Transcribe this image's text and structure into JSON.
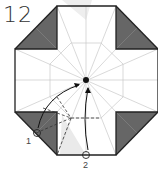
{
  "step_number": "12",
  "labels": {
    "one": "1",
    "two": "2"
  },
  "colors": {
    "outline": "#222222",
    "shade": "#666666",
    "crease": "#c8c8c8",
    "ghost": "#e6e6e6"
  }
}
